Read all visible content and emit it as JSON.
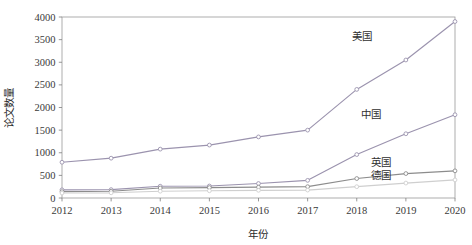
{
  "chart_data": {
    "type": "line",
    "title": "",
    "xlabel": "年份",
    "ylabel": "论文数量",
    "grid": false,
    "legend_position": "inline-right-of-line-ends",
    "categories": [
      "2012",
      "2013",
      "2014",
      "2015",
      "2016",
      "2017",
      "2018",
      "2019",
      "2020"
    ],
    "x": [
      2012,
      2013,
      2014,
      2015,
      2016,
      2017,
      2018,
      2019,
      2020
    ],
    "xlim": [
      2012,
      2020
    ],
    "ylim": [
      0,
      4000
    ],
    "ytick_labels": [
      "0",
      "500",
      "1000",
      "1500",
      "2000",
      "2500",
      "3000",
      "3500",
      "4000"
    ],
    "yticks": [
      0,
      500,
      1000,
      1500,
      2000,
      2500,
      3000,
      3500,
      4000
    ],
    "series": [
      {
        "name": "美国",
        "color": "#9b93ae",
        "values": [
          790,
          880,
          1080,
          1170,
          1350,
          1500,
          2400,
          3050,
          3900
        ]
      },
      {
        "name": "中国",
        "color": "#9b93ae",
        "values": [
          180,
          185,
          260,
          265,
          320,
          390,
          960,
          1420,
          1840
        ]
      },
      {
        "name": "英国",
        "color": "#8c8c8c",
        "values": [
          140,
          150,
          220,
          230,
          240,
          250,
          430,
          540,
          600
        ]
      },
      {
        "name": "德国",
        "color": "#cfcfcf",
        "values": [
          110,
          115,
          150,
          160,
          170,
          175,
          250,
          330,
          400
        ]
      }
    ],
    "annotations": [
      {
        "text": "美国",
        "x": 2018.1,
        "y": 3490
      },
      {
        "text": "中国",
        "x": 2018.3,
        "y": 1760
      },
      {
        "text": "英国",
        "x": 2018.5,
        "y": 700
      },
      {
        "text": "德国",
        "x": 2018.5,
        "y": 430
      }
    ]
  },
  "axis": {
    "x_title": "年份",
    "y_title": "论文数量"
  }
}
